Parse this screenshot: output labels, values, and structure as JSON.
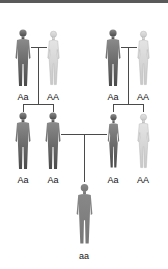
{
  "diagram": {
    "type": "pedigree",
    "colors": {
      "dark_figure": "#5e5e5e",
      "medium_figure": "#7a7a7a",
      "light_figure": "#d4d4d4",
      "line": "#4a4a4a",
      "top_bar": "#5a5a5a"
    },
    "generation1": [
      {
        "sex": "male",
        "genotype": "Aa",
        "shade": "dark"
      },
      {
        "sex": "female",
        "genotype": "AA",
        "shade": "light"
      },
      {
        "sex": "male",
        "genotype": "Aa",
        "shade": "dark"
      },
      {
        "sex": "female",
        "genotype": "AA",
        "shade": "light"
      }
    ],
    "generation2": [
      {
        "sex": "male",
        "genotype": "Aa",
        "shade": "dark"
      },
      {
        "sex": "male",
        "genotype": "Aa",
        "shade": "dark"
      },
      {
        "sex": "female",
        "genotype": "Aa",
        "shade": "dark"
      },
      {
        "sex": "female",
        "genotype": "AA",
        "shade": "light"
      }
    ],
    "generation3": [
      {
        "sex": "male",
        "genotype": "aa",
        "shade": "medium"
      }
    ]
  }
}
